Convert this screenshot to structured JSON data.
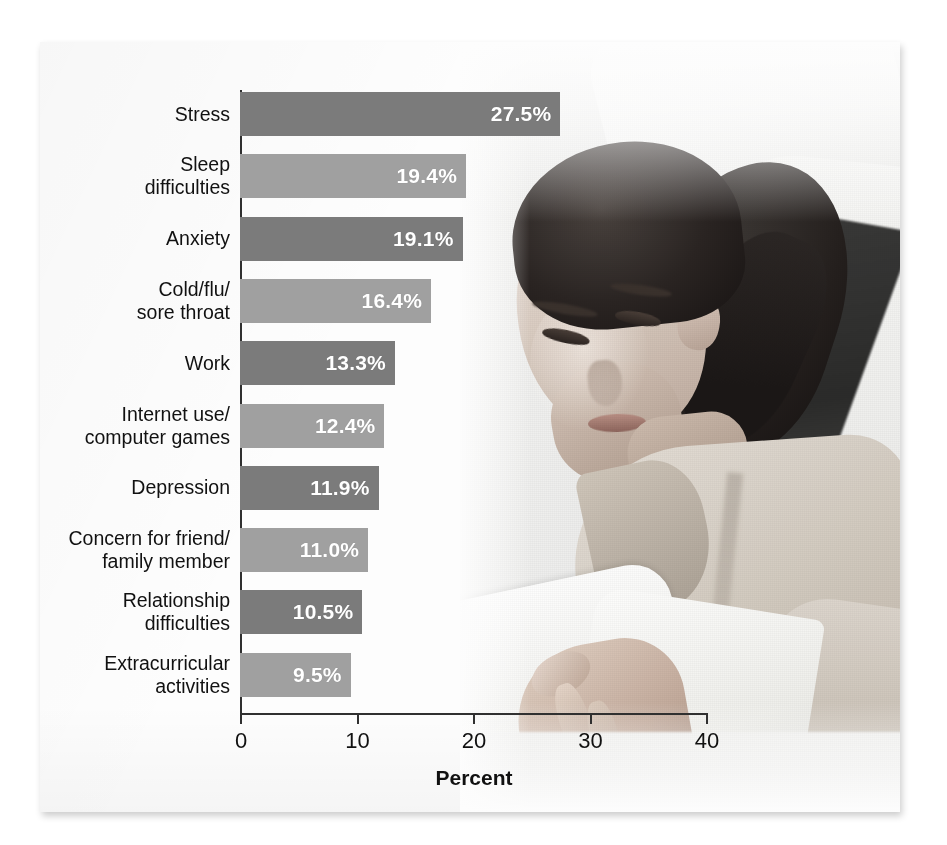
{
  "chart_data": {
    "type": "bar",
    "orientation": "horizontal",
    "title": "",
    "xlabel": "Percent",
    "ylabel": "",
    "xlim": [
      0,
      40
    ],
    "xticks": [
      "0",
      "10",
      "20",
      "30",
      "40"
    ],
    "grid": false,
    "legend": null,
    "categories": [
      "Stress",
      "Sleep\ndifficulties",
      "Anxiety",
      "Cold/flu/\nsore throat",
      "Work",
      "Internet use/\ncomputer games",
      "Depression",
      "Concern for friend/\nfamily member",
      "Relationship\ndifficulties",
      "Extracurricular\nactivities"
    ],
    "values": [
      27.5,
      19.4,
      19.1,
      16.4,
      13.3,
      12.4,
      11.9,
      11.0,
      10.5,
      9.5
    ],
    "value_labels": [
      "27.5%",
      "19.4%",
      "19.1%",
      "16.4%",
      "13.3%",
      "12.4%",
      "11.9%",
      "11.0%",
      "10.5%",
      "9.5%"
    ],
    "bar_shades": [
      "dark",
      "light",
      "dark",
      "light",
      "dark",
      "light",
      "dark",
      "light",
      "dark",
      "light"
    ],
    "colors": {
      "bar_dark": "#7b7b7b",
      "bar_light": "#a0a0a0",
      "value_text": "#ffffff",
      "axis": "#303030",
      "label_text": "#111111",
      "background": "#fdfdfd"
    }
  },
  "photo": {
    "description": "Grayscale photograph of a young woman lying down reading an open book"
  }
}
